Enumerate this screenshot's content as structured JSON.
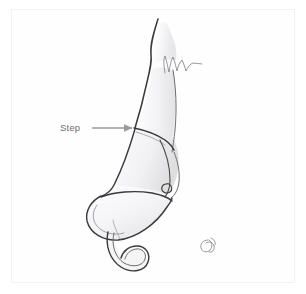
{
  "figure": {
    "domain_type": "anatomical-line-drawing",
    "view": "lateral",
    "background_color": "#ffffff",
    "frame_color": "#f2f2f4",
    "ink_color": "#3a3a3c",
    "shade_color": "#ededf0",
    "annotation_color": "#6e6e72"
  },
  "annotations": [
    {
      "id": "step",
      "label": "Step",
      "label_x": 60,
      "label_y": 131,
      "arrow": {
        "from_x": 92,
        "from_y": 128,
        "to_x": 133,
        "to_y": 128,
        "color": "#9a9a9e",
        "head_width": 9,
        "head_length": 9
      }
    }
  ],
  "signature": {
    "text": "ℰ",
    "x": 205,
    "y": 249,
    "color": "#8d8d93"
  },
  "structures": [
    {
      "name": "nasal-dorsum-upper",
      "description": "Upper dorsal profile line descending from radix"
    },
    {
      "name": "osteotomy-zigzag-line",
      "description": "Serrated/zigzag line marking bone cut"
    },
    {
      "name": "dorsal-step-junction",
      "description": "Transverse step line across dorsum"
    },
    {
      "name": "upper-lateral-cartilage",
      "description": "Shaded cartilage panel below step"
    },
    {
      "name": "lower-lateral-cartilage",
      "description": "Alar cartilage forming nasal tip"
    },
    {
      "name": "sesamoid-oval",
      "description": "Small oval accessory cartilage"
    },
    {
      "name": "columella-hook",
      "description": "Hooked columella / medial crus tail"
    }
  ]
}
